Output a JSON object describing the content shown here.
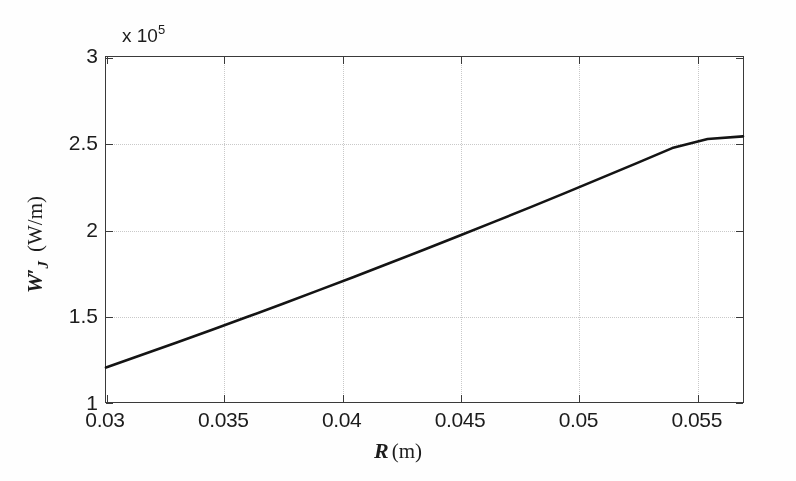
{
  "chart_data": {
    "type": "line",
    "title": "",
    "subtitle": "",
    "xlabel": "R (m)",
    "ylabel": "W'_J (W/m)",
    "xlim": [
      0.03,
      0.057
    ],
    "ylim": [
      100000,
      300000
    ],
    "y_exponent_label": "x 10",
    "y_exponent_power": "5",
    "y_scale_factor": 100000,
    "grid": true,
    "legend": null,
    "xticks": [
      0.03,
      0.035,
      0.04,
      0.045,
      0.05,
      0.055
    ],
    "xtick_labels": [
      "0.03",
      "0.035",
      "0.04",
      "0.045",
      "0.05",
      "0.055"
    ],
    "yticks": [
      100000,
      150000,
      200000,
      250000,
      300000
    ],
    "ytick_labels": [
      "1",
      "1.5",
      "2",
      "2.5",
      "3"
    ],
    "series": [
      {
        "name": "W'_J",
        "color": "#141414",
        "linewidth": 2.6,
        "x": [
          0.03,
          0.0315,
          0.033,
          0.0345,
          0.036,
          0.0375,
          0.039,
          0.0405,
          0.042,
          0.0435,
          0.045,
          0.0465,
          0.048,
          0.0495,
          0.051,
          0.0525,
          0.054,
          0.0555,
          0.057
        ],
        "values": [
          120000,
          127200,
          134500,
          141900,
          149400,
          157000,
          164700,
          172500,
          180400,
          188400,
          196500,
          204700,
          213000,
          221400,
          229900,
          238500,
          247200,
          252500,
          254000
        ]
      }
    ],
    "annotations": []
  },
  "axes": {
    "x_axis_title_symbol": "R",
    "x_axis_title_unit": "(m)",
    "y_axis_title_symbol": "W",
    "y_axis_title_prime": "′",
    "y_axis_title_subscript": "J",
    "y_axis_title_unit": "(W/m)",
    "exponent_prefix": "x 10",
    "exponent_power": "5"
  },
  "style": {
    "axis_color": "#3a3a3a",
    "grid_color": "#c9c9c9",
    "curve_color": "#141414",
    "text_color": "#1c1c1c",
    "background": "#ffffff"
  }
}
